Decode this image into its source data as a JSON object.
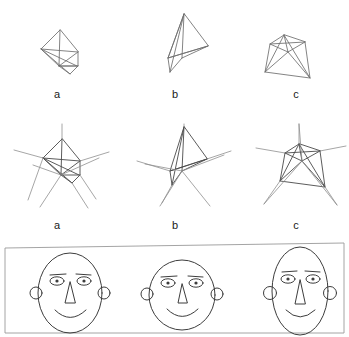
{
  "figure": {
    "title_visible": false,
    "background_color": "#ffffff",
    "stroke_color": "#6e6e6e",
    "face_stroke_color": "#3d3d3d",
    "panel_border_color": "#9a9a9a",
    "row1": {
      "description": "Three wireframe polyhedra shown as plain line drawings",
      "items": [
        {
          "label": "a",
          "shape_name": "tetrahedron-wireframe",
          "label_x": 57,
          "label_y": 88
        },
        {
          "label": "b",
          "shape_name": "tilted-pyramid-wireframe",
          "label_x": 175,
          "label_y": 88
        },
        {
          "label": "c",
          "shape_name": "truncated-pyramid-wireframe",
          "label_x": 296,
          "label_y": 88
        }
      ]
    },
    "row2": {
      "description": "The same three polyhedra with edges extended outward as long rays",
      "items": [
        {
          "label": "a",
          "shape_name": "tetrahedron-extended-rays",
          "label_x": 57,
          "label_y": 219
        },
        {
          "label": "b",
          "shape_name": "tilted-pyramid-extended-rays",
          "label_x": 175,
          "label_y": 219
        },
        {
          "label": "c",
          "shape_name": "truncated-pyramid-extended-rays",
          "label_x": 296,
          "label_y": 219
        }
      ]
    },
    "row3": {
      "description": "Bordered panel containing three line-drawn cartoon faces of differing aspect ratios",
      "faces": [
        {
          "face_name": "face-oval-tall",
          "cx": 70,
          "cy": 293,
          "rx": 32,
          "ry": 40
        },
        {
          "face_name": "face-round-wide",
          "cx": 182,
          "cy": 295,
          "rx": 33,
          "ry": 35
        },
        {
          "face_name": "face-narrow-tall",
          "cx": 300,
          "cy": 291,
          "rx": 28,
          "ry": 44
        }
      ],
      "face_parts": [
        "head-outline",
        "left-eye",
        "right-eye",
        "left-eyebrow",
        "right-eyebrow",
        "nose",
        "mouth",
        "left-ear",
        "right-ear"
      ]
    }
  }
}
